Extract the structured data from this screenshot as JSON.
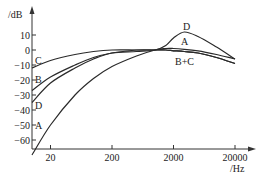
{
  "chart_data": {
    "type": "line",
    "title": "",
    "xlabel": "/Hz",
    "ylabel": "/dB",
    "xscale": "log",
    "xlim": [
      10,
      30000
    ],
    "ylim": [
      -70,
      15
    ],
    "grid": false,
    "legend": "inline curve labels",
    "x_ticks": [
      20,
      200,
      2000,
      20000
    ],
    "x_tick_labels": [
      "20",
      "200",
      "2000",
      "20000"
    ],
    "y_ticks": [
      10,
      0,
      -10,
      -20,
      -30,
      -40,
      -50,
      -60
    ],
    "y_tick_labels": [
      "10",
      "0",
      "-10",
      "-20",
      "-30",
      "-40",
      "-50",
      "-60"
    ],
    "x": [
      10,
      20,
      50,
      100,
      200,
      500,
      1000,
      1500,
      2000,
      3000,
      5000,
      10000,
      20000
    ],
    "series": [
      {
        "name": "A",
        "values": [
          -70,
          -50,
          -30,
          -19,
          -11,
          -4,
          0,
          1,
          1,
          0.5,
          -0.5,
          -3,
          -6
        ]
      },
      {
        "name": "B",
        "values": [
          -27,
          -18,
          -10,
          -5,
          -2,
          0,
          0,
          0,
          -0.5,
          -1,
          -2,
          -5,
          -9
        ]
      },
      {
        "name": "C",
        "values": [
          -12,
          -7,
          -3,
          -1,
          0,
          0,
          0,
          0,
          -0.5,
          -1,
          -2,
          -5,
          -9
        ]
      },
      {
        "name": "D",
        "values": [
          -35,
          -22,
          -12,
          -6,
          -2,
          -1,
          0,
          3,
          8,
          12,
          9,
          2,
          -6
        ]
      }
    ],
    "annotations": [
      {
        "text": "A",
        "near": "left, -53 dB"
      },
      {
        "text": "B",
        "near": "left, -20 dB"
      },
      {
        "text": "C",
        "near": "left, -7 dB"
      },
      {
        "text": "D",
        "near": "left, -41 dB"
      },
      {
        "text": "D",
        "near": "peak ~3000 Hz, +12 dB"
      },
      {
        "text": "A",
        "near": "~3000 Hz, +4 dB"
      },
      {
        "text": "B+C",
        "near": "~3000 Hz, -8 dB"
      }
    ]
  },
  "labels": {
    "y_title": "/dB",
    "x_title": "/Hz",
    "curve_A_left": "A",
    "curve_B_left": "B",
    "curve_C_left": "C",
    "curve_D_left": "D",
    "curve_D_right": "D",
    "curve_A_right": "A",
    "curve_BC_right": "B+C"
  }
}
